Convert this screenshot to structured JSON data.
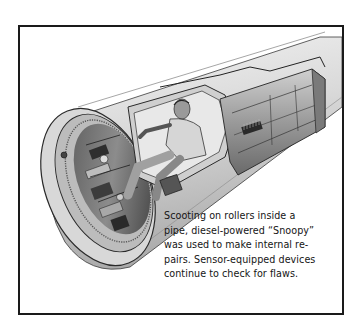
{
  "figure": {
    "colors": {
      "border": "#1a1a1a",
      "background": "#ffffff",
      "text": "#151515",
      "ink_dark": "#2a2a2a",
      "ink_mid": "#7a7a7a",
      "pipe_light": "#e6e6e6",
      "pipe_shade": "#bdbdbd"
    }
  },
  "caption": {
    "lines": [
      "Scooting on rollers inside a",
      "pipe, diesel-powered “Snoopy”",
      "was used to make internal re-",
      "pairs. Sensor-equipped devices",
      "continue to check for flaws."
    ]
  }
}
